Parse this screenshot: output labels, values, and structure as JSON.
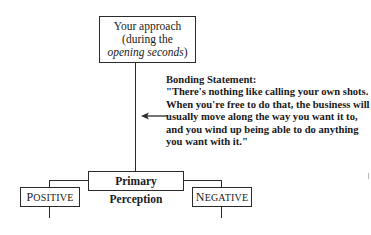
{
  "diagram": {
    "top_box": {
      "line1": "Your approach",
      "line2": "(during the",
      "line3_italic": "opening seconds",
      "line3_close": ")"
    },
    "statement": {
      "title": "Bonding Statement:",
      "quote": "\"There's nothing like calling your own shots. When you're free to do that, the business will usually move along the way you want it to, and you wind up being able to do anything you want with it.\""
    },
    "primary_box": {
      "label": "Primary Perception"
    },
    "positive_box": {
      "first": "P",
      "rest": "OSITIVE"
    },
    "negative_box": {
      "first": "N",
      "rest": "EGATIVE"
    },
    "arrow": {
      "direction": "left"
    }
  }
}
